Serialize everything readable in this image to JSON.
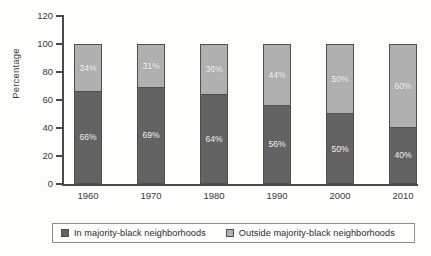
{
  "chart_data": {
    "type": "bar",
    "stacked": true,
    "title": "",
    "xlabel": "",
    "ylabel": "Percentage",
    "categories": [
      "1960",
      "1970",
      "1980",
      "1990",
      "2000",
      "2010"
    ],
    "ylim": [
      0,
      120
    ],
    "yticks": [
      "0",
      "20",
      "40",
      "60",
      "80",
      "100",
      "120"
    ],
    "grid": false,
    "legend_position": "bottom",
    "series": [
      {
        "name": "In majority-black neighborhoods",
        "color": "#636363",
        "values": [
          66,
          69,
          64,
          56,
          50,
          40
        ],
        "labels": [
          "66%",
          "69%",
          "64%",
          "56%",
          "50%",
          "40%"
        ]
      },
      {
        "name": "Outside majority-black neighborhoods",
        "color": "#b0b0b0",
        "values": [
          34,
          31,
          36,
          44,
          50,
          60
        ],
        "labels": [
          "34%",
          "31%",
          "36%",
          "44%",
          "50%",
          "60%"
        ]
      }
    ]
  },
  "legend": {
    "items": [
      {
        "label": "In majority-black neighborhoods",
        "color": "#636363"
      },
      {
        "label": "Outside majority-black neighborhoods",
        "color": "#b0b0b0"
      }
    ]
  }
}
